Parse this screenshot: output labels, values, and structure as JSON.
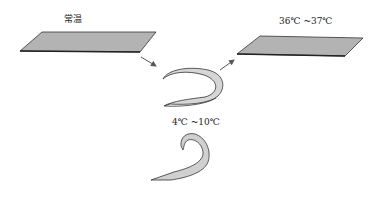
{
  "diagram": {
    "labels": {
      "room_temp": "常温",
      "body_temp": "36℃ ~37℃",
      "cold_temp": "4℃ ~10℃"
    },
    "colors": {
      "sheet_fill": "#b3b3b3",
      "curl_fill": "#d6d6d6",
      "stroke": "#333333",
      "arrow": "#555555"
    }
  }
}
